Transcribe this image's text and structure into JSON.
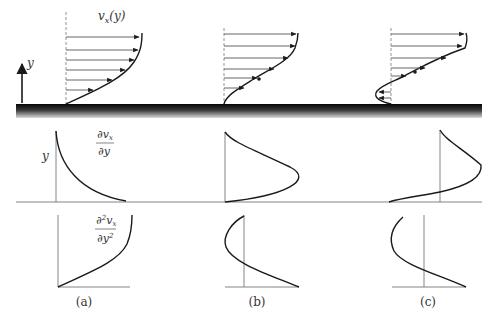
{
  "figure": {
    "profile_label": "v",
    "profile_sub": "x",
    "profile_arg": "(y)",
    "y_axis_label": "y",
    "first_derivative": {
      "num": "∂v",
      "num_sub": "x",
      "den": "∂y"
    },
    "second_derivative": {
      "num_d": "∂",
      "num_sup": "2",
      "num_v": "v",
      "num_sub": "x",
      "den": "∂y",
      "den_sup": "2"
    },
    "row_label_y": "y",
    "panels": [
      {
        "id": "a",
        "caption": "(a)"
      },
      {
        "id": "b",
        "caption": "(b)"
      },
      {
        "id": "c",
        "caption": "(c)"
      }
    ]
  },
  "colors": {
    "ink": "#1a1a1a",
    "axis": "#777777",
    "plate_dark": "#0a0a0a",
    "plate_light": "#d8d8d8"
  }
}
